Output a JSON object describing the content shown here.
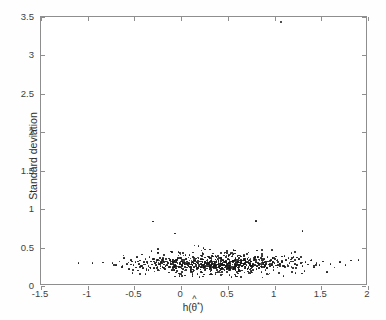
{
  "figure": {
    "title": "",
    "background_color": "#ffffff",
    "frame_color": "#8e8e8e",
    "point_color": "#161616"
  },
  "chart_data": {
    "type": "scatter",
    "title": "",
    "xlabel": "h(θ̂*)",
    "ylabel": "Standard deviation",
    "xlim": [
      -1.5,
      2
    ],
    "ylim": [
      0,
      3.5
    ],
    "xticks": [
      -1.5,
      -1,
      -0.5,
      0,
      0.5,
      1,
      1.5,
      2
    ],
    "xticklabels": [
      "-1.5",
      "-1",
      "-0.5",
      "0",
      "0.5",
      "1",
      "1.5",
      "2"
    ],
    "yticks": [
      0,
      0.5,
      1,
      1.5,
      2,
      2.5,
      3,
      3.5
    ],
    "yticklabels": [
      "0",
      "0.5",
      "1",
      "1.5",
      "2",
      "2.5",
      "3",
      "3.5"
    ],
    "grid": false,
    "legend": null,
    "marker": "dot",
    "marker_size": 1.6,
    "n_points": 806,
    "points": [
      [
        -1.1,
        0.3
      ],
      [
        -0.95,
        0.3
      ],
      [
        -0.7,
        0.27
      ],
      [
        -0.66,
        0.32
      ],
      [
        -0.63,
        0.25
      ],
      [
        -0.61,
        0.36
      ],
      [
        -0.58,
        0.29
      ],
      [
        -0.56,
        0.22
      ],
      [
        -0.54,
        0.34
      ],
      [
        -0.52,
        0.17
      ],
      [
        -0.51,
        0.27
      ],
      [
        -0.49,
        0.31
      ],
      [
        -0.48,
        0.24
      ],
      [
        -0.47,
        0.38
      ],
      [
        -0.46,
        0.2
      ],
      [
        -0.45,
        0.29
      ],
      [
        -0.44,
        0.33
      ],
      [
        -0.43,
        0.26
      ],
      [
        -0.42,
        0.41
      ],
      [
        -0.41,
        0.23
      ],
      [
        -0.4,
        0.31
      ],
      [
        -0.39,
        0.28
      ],
      [
        -0.38,
        0.35
      ],
      [
        -0.37,
        0.22
      ],
      [
        -0.36,
        0.3
      ],
      [
        -0.35,
        0.26
      ],
      [
        -0.34,
        0.38
      ],
      [
        -0.33,
        0.24
      ],
      [
        -0.32,
        0.32
      ],
      [
        -0.31,
        0.28
      ],
      [
        -0.3,
        0.84
      ],
      [
        -0.3,
        0.35
      ],
      [
        -0.29,
        0.23
      ],
      [
        -0.28,
        0.3
      ],
      [
        -0.27,
        0.27
      ],
      [
        -0.26,
        0.34
      ],
      [
        -0.25,
        0.21
      ],
      [
        -0.25,
        0.48
      ],
      [
        -0.24,
        0.29
      ],
      [
        -0.23,
        0.33
      ],
      [
        -0.22,
        0.26
      ],
      [
        -0.21,
        0.31
      ],
      [
        -0.2,
        0.24
      ],
      [
        -0.19,
        0.36
      ],
      [
        -0.18,
        0.28
      ],
      [
        -0.17,
        0.22
      ],
      [
        -0.16,
        0.32
      ],
      [
        -0.15,
        0.27
      ],
      [
        -0.14,
        0.3
      ],
      [
        -0.13,
        0.25
      ],
      [
        -0.12,
        0.34
      ],
      [
        -0.11,
        0.29
      ],
      [
        -0.1,
        0.21
      ],
      [
        -0.1,
        0.44
      ],
      [
        -0.09,
        0.31
      ],
      [
        -0.08,
        0.26
      ],
      [
        -0.07,
        0.33
      ],
      [
        -0.06,
        0.28
      ],
      [
        -0.05,
        0.23
      ],
      [
        -0.04,
        0.3
      ],
      [
        -0.03,
        0.36
      ],
      [
        -0.02,
        0.25
      ],
      [
        -0.01,
        0.29
      ],
      [
        0.0,
        0.32
      ],
      [
        0.01,
        0.27
      ],
      [
        0.02,
        0.22
      ],
      [
        0.03,
        0.31
      ],
      [
        0.04,
        0.28
      ],
      [
        0.05,
        0.35
      ],
      [
        0.06,
        0.24
      ],
      [
        0.07,
        0.3
      ],
      [
        0.08,
        0.26
      ],
      [
        0.09,
        0.33
      ],
      [
        0.1,
        0.21
      ],
      [
        0.11,
        0.29
      ],
      [
        0.12,
        0.27
      ],
      [
        0.13,
        0.31
      ],
      [
        0.14,
        0.25
      ],
      [
        0.15,
        0.34
      ],
      [
        0.16,
        0.28
      ],
      [
        0.17,
        0.23
      ],
      [
        0.18,
        0.3
      ],
      [
        0.19,
        0.26
      ],
      [
        0.2,
        0.32
      ],
      [
        0.21,
        0.29
      ],
      [
        0.22,
        0.24
      ],
      [
        0.23,
        0.35
      ],
      [
        0.24,
        0.27
      ],
      [
        0.25,
        0.31
      ],
      [
        0.26,
        0.22
      ],
      [
        0.27,
        0.28
      ],
      [
        0.28,
        0.33
      ],
      [
        0.29,
        0.26
      ],
      [
        0.3,
        0.3
      ],
      [
        0.31,
        0.24
      ],
      [
        0.32,
        0.36
      ],
      [
        0.33,
        0.29
      ],
      [
        0.34,
        0.25
      ],
      [
        0.35,
        0.32
      ],
      [
        0.36,
        0.27
      ],
      [
        0.37,
        0.23
      ],
      [
        0.38,
        0.31
      ],
      [
        0.39,
        0.28
      ],
      [
        0.4,
        0.34
      ],
      [
        0.41,
        0.26
      ],
      [
        0.42,
        0.3
      ],
      [
        0.43,
        0.22
      ],
      [
        0.44,
        0.29
      ],
      [
        0.45,
        0.33
      ],
      [
        0.46,
        0.27
      ],
      [
        0.47,
        0.24
      ],
      [
        0.48,
        0.31
      ],
      [
        0.49,
        0.28
      ],
      [
        0.5,
        0.35
      ],
      [
        0.51,
        0.26
      ],
      [
        0.52,
        0.3
      ],
      [
        0.53,
        0.23
      ],
      [
        0.54,
        0.32
      ],
      [
        0.55,
        0.28
      ],
      [
        0.56,
        0.25
      ],
      [
        0.57,
        0.34
      ],
      [
        0.58,
        0.29
      ],
      [
        0.59,
        0.27
      ],
      [
        0.6,
        0.31
      ],
      [
        0.61,
        0.24
      ],
      [
        0.62,
        0.36
      ],
      [
        0.63,
        0.28
      ],
      [
        0.64,
        0.3
      ],
      [
        0.65,
        0.26
      ],
      [
        0.66,
        0.33
      ],
      [
        0.67,
        0.29
      ],
      [
        0.68,
        0.23
      ],
      [
        0.69,
        0.31
      ],
      [
        0.7,
        0.27
      ],
      [
        0.71,
        0.35
      ],
      [
        0.72,
        0.25
      ],
      [
        0.73,
        0.3
      ],
      [
        0.74,
        0.28
      ],
      [
        0.75,
        0.32
      ],
      [
        0.76,
        0.24
      ],
      [
        0.77,
        0.29
      ],
      [
        0.78,
        0.34
      ],
      [
        0.79,
        0.27
      ],
      [
        0.8,
        0.85
      ],
      [
        0.8,
        0.31
      ],
      [
        0.81,
        0.26
      ],
      [
        0.82,
        0.3
      ],
      [
        0.83,
        0.23
      ],
      [
        0.84,
        0.33
      ],
      [
        0.85,
        0.28
      ],
      [
        0.86,
        0.25
      ],
      [
        0.87,
        0.31
      ],
      [
        0.88,
        0.29
      ],
      [
        0.89,
        0.35
      ],
      [
        0.9,
        0.27
      ],
      [
        0.91,
        0.3
      ],
      [
        0.92,
        0.24
      ],
      [
        0.93,
        0.32
      ],
      [
        0.94,
        0.28
      ],
      [
        0.95,
        0.26
      ],
      [
        0.96,
        0.34
      ],
      [
        0.97,
        0.29
      ],
      [
        0.98,
        0.31
      ],
      [
        0.99,
        0.25
      ],
      [
        1.0,
        0.3
      ],
      [
        1.02,
        0.33
      ],
      [
        1.04,
        0.27
      ],
      [
        1.06,
        0.29
      ],
      [
        1.07,
        3.44
      ],
      [
        1.08,
        0.31
      ],
      [
        1.1,
        0.26
      ],
      [
        1.12,
        0.34
      ],
      [
        1.14,
        0.28
      ],
      [
        1.16,
        0.3
      ],
      [
        1.18,
        0.24
      ],
      [
        1.2,
        0.32
      ],
      [
        1.22,
        0.29
      ],
      [
        1.24,
        0.27
      ],
      [
        1.26,
        0.35
      ],
      [
        1.28,
        0.3
      ],
      [
        1.3,
        0.72
      ],
      [
        1.3,
        0.26
      ],
      [
        1.33,
        0.31
      ],
      [
        1.36,
        0.28
      ],
      [
        1.39,
        0.33
      ],
      [
        1.42,
        0.25
      ],
      [
        1.45,
        0.3
      ],
      [
        1.48,
        0.27
      ],
      [
        1.52,
        0.32
      ],
      [
        1.56,
        0.18
      ],
      [
        1.6,
        0.29
      ],
      [
        1.64,
        0.24
      ],
      [
        1.7,
        0.31
      ],
      [
        1.76,
        0.27
      ],
      [
        1.82,
        0.33
      ],
      [
        1.9,
        0.34
      ]
    ]
  },
  "accessibility": {
    "description": "Scatter plot of standard deviation versus h(theta-hat-star)"
  }
}
